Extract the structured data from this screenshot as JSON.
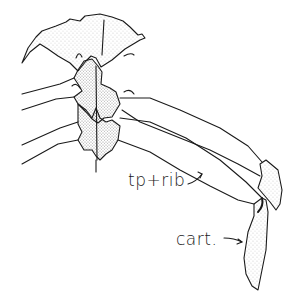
{
  "figure": {
    "labels": [
      {
        "id": "tprib",
        "text": "tp+rib"
      },
      {
        "id": "cart",
        "text": "cart."
      }
    ]
  }
}
